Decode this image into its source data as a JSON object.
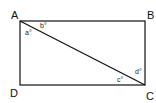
{
  "diagram": {
    "type": "rectangle-with-diagonal",
    "stroke_color": "#111111",
    "vertices": [
      {
        "label": "A",
        "x": 20,
        "y": 21,
        "lx": 11,
        "ly": 19
      },
      {
        "label": "B",
        "x": 145,
        "y": 21,
        "lx": 147,
        "ly": 19
      },
      {
        "label": "C",
        "x": 145,
        "y": 85,
        "lx": 146,
        "ly": 100
      },
      {
        "label": "D",
        "x": 20,
        "y": 85,
        "lx": 10,
        "ly": 97
      }
    ],
    "diagonal": {
      "from": "A",
      "to": "C"
    },
    "angles": [
      {
        "label": "a°",
        "x": 25,
        "y": 35
      },
      {
        "label": "b°",
        "x": 40,
        "y": 28
      },
      {
        "label": "c°",
        "x": 117,
        "y": 82
      },
      {
        "label": "d°",
        "x": 135,
        "y": 74
      }
    ]
  }
}
